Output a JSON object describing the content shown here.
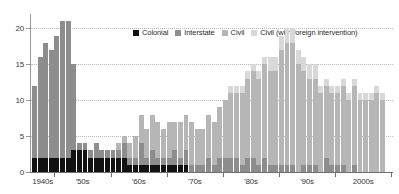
{
  "chart_data": {
    "type": "bar",
    "title": "",
    "subtitle": "",
    "xlabel": "",
    "ylabel": "",
    "stacked": true,
    "grid": true,
    "legend_position": "top-center",
    "ylim": [
      0,
      22
    ],
    "yticks": [
      0,
      5,
      10,
      15,
      20
    ],
    "ytick_labels": [
      "0",
      "5",
      "10",
      "15",
      "20"
    ],
    "xtick_labels": [
      "1940s",
      "'50s",
      "'60s",
      "'70s",
      "'80s",
      "'90s",
      "2000s"
    ],
    "x_start_year": 1946,
    "x_end_year": 2008,
    "x": [
      1946,
      1947,
      1948,
      1949,
      1950,
      1951,
      1952,
      1953,
      1954,
      1955,
      1956,
      1957,
      1958,
      1959,
      1960,
      1961,
      1962,
      1963,
      1964,
      1965,
      1966,
      1967,
      1968,
      1969,
      1970,
      1971,
      1972,
      1973,
      1974,
      1975,
      1976,
      1977,
      1978,
      1979,
      1980,
      1981,
      1982,
      1983,
      1984,
      1985,
      1986,
      1987,
      1988,
      1989,
      1990,
      1991,
      1992,
      1993,
      1994,
      1995,
      1996,
      1997,
      1998,
      1999,
      2000,
      2001,
      2002,
      2003,
      2004,
      2005,
      2006,
      2007,
      2008
    ],
    "series": [
      {
        "name": "Colonial",
        "color": "#111111",
        "values": [
          2,
          2,
          2,
          2,
          2,
          2,
          2,
          3,
          3,
          3,
          2,
          2,
          2,
          2,
          2,
          2,
          2,
          1,
          1,
          1,
          1,
          1,
          1,
          1,
          1,
          1,
          1,
          1,
          0,
          0,
          0,
          0,
          0,
          0,
          0,
          0,
          0,
          0,
          0,
          0,
          0,
          0,
          0,
          0,
          0,
          0,
          0,
          0,
          0,
          0,
          0,
          0,
          0,
          0,
          0,
          0,
          0,
          0,
          0,
          0,
          0,
          0,
          0
        ]
      },
      {
        "name": "Interstate",
        "color": "#8d8d8d",
        "values": [
          10,
          14,
          16,
          15,
          17,
          19,
          19,
          12,
          1,
          1,
          1,
          2,
          1,
          1,
          1,
          1,
          2,
          1,
          1,
          3,
          1,
          2,
          1,
          1,
          1,
          2,
          1,
          2,
          1,
          1,
          1,
          2,
          1,
          2,
          2,
          2,
          2,
          1,
          2,
          2,
          1,
          2,
          1,
          1,
          1,
          1,
          1,
          0,
          1,
          1,
          1,
          0,
          2,
          1,
          1,
          1,
          0,
          1,
          0,
          0,
          0,
          0,
          0
        ]
      },
      {
        "name": "Civil",
        "color": "#b6b6b6",
        "values": [
          0,
          0,
          0,
          0,
          0,
          0,
          0,
          0,
          0,
          0,
          0,
          0,
          0,
          0,
          0,
          1,
          1,
          2,
          3,
          4,
          4,
          5,
          5,
          4,
          5,
          4,
          5,
          5,
          6,
          5,
          5,
          6,
          6,
          7,
          8,
          9,
          9,
          10,
          11,
          12,
          12,
          13,
          13,
          13,
          16,
          17,
          17,
          15,
          13,
          12,
          12,
          11,
          10,
          10,
          10,
          11,
          10,
          11,
          10,
          10,
          10,
          11,
          10
        ]
      },
      {
        "name": "Civil (with foreign intervention)",
        "color": "#d8d8d8",
        "values": [
          0,
          0,
          0,
          0,
          0,
          0,
          0,
          0,
          0,
          0,
          0,
          0,
          0,
          0,
          0,
          0,
          0,
          0,
          0,
          0,
          0,
          0,
          0,
          0,
          0,
          0,
          0,
          0,
          0,
          0,
          0,
          0,
          0,
          0,
          0,
          1,
          1,
          1,
          1,
          1,
          1,
          1,
          2,
          2,
          2,
          2,
          2,
          2,
          2,
          2,
          2,
          1,
          1,
          1,
          1,
          1,
          1,
          1,
          1,
          1,
          1,
          1,
          1
        ]
      }
    ],
    "totals": [
      12,
      16,
      18,
      17,
      19,
      21,
      21,
      15,
      4,
      4,
      3,
      4,
      3,
      3,
      3,
      4,
      5,
      4,
      5,
      8,
      6,
      8,
      7,
      6,
      7,
      7,
      7,
      8,
      7,
      6,
      6,
      8,
      7,
      9,
      10,
      12,
      12,
      12,
      14,
      15,
      14,
      16,
      16,
      16,
      19,
      20,
      20,
      17,
      16,
      15,
      15,
      12,
      13,
      12,
      12,
      13,
      11,
      13,
      11,
      11,
      11,
      12,
      11
    ]
  }
}
